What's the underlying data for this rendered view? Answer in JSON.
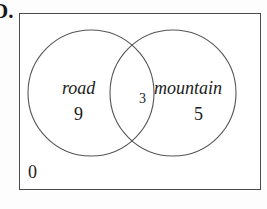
{
  "question_label": "D.",
  "diagram": {
    "type": "venn-2-set",
    "universe": {
      "name": "universal-set",
      "outside_count": "0"
    },
    "sets": [
      {
        "id": "road",
        "label": "road",
        "only_count": "9"
      },
      {
        "id": "mountain",
        "label": "mountain",
        "only_count": "5"
      }
    ],
    "intersection_count": "3"
  },
  "colors": {
    "stroke": "#4a4a4a",
    "circle_stroke": "#555555",
    "text": "#1c1c1c",
    "background": "#ffffff",
    "page_background": "#fdfdfd"
  }
}
